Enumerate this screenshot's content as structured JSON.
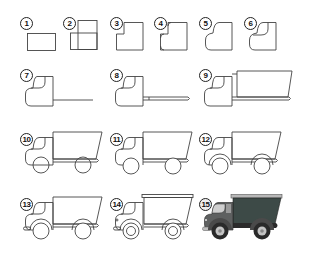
{
  "steps": [
    {
      "n": "1"
    },
    {
      "n": "2"
    },
    {
      "n": "3"
    },
    {
      "n": "4"
    },
    {
      "n": "5"
    },
    {
      "n": "6"
    },
    {
      "n": "7"
    },
    {
      "n": "8"
    },
    {
      "n": "9"
    },
    {
      "n": "10"
    },
    {
      "n": "11"
    },
    {
      "n": "12"
    },
    {
      "n": "13"
    },
    {
      "n": "14"
    },
    {
      "n": "15"
    }
  ],
  "colors": {
    "outline": "#444444",
    "cargo_bed": "#3d4a47",
    "cargo_rim": "#b8b8b8",
    "cab_body": "#5e6060",
    "cab_window": "#cfcfcf",
    "chassis": "#2b2b2b",
    "tire": "#2a2a2a",
    "hub": "#c4c4c4",
    "bumper": "#bdbdbd"
  }
}
